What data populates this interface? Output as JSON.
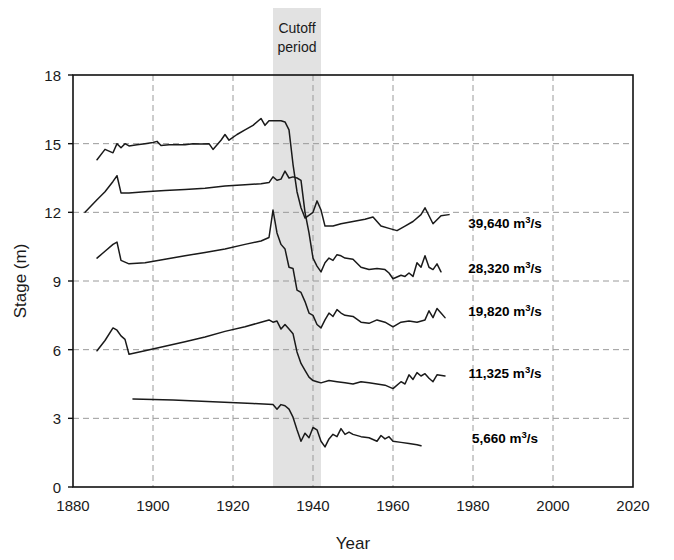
{
  "chart_data": {
    "type": "line",
    "title": "",
    "xlabel": "Year",
    "ylabel": "Stage (m)",
    "xlim": [
      1880,
      2020
    ],
    "ylim": [
      0,
      18
    ],
    "xticks": [
      1880,
      1900,
      1920,
      1940,
      1960,
      1980,
      2000,
      2020
    ],
    "yticks": [
      0,
      3,
      6,
      9,
      12,
      15,
      18
    ],
    "grid": "dashed gray gridlines on both axes, solid black plot frame",
    "legend_position": "inline right of each line end",
    "annotations": [
      {
        "text": "Cutoff period",
        "lines": [
          "Cutoff",
          "period"
        ],
        "type": "shaded-vertical-band",
        "x_start": 1930,
        "x_end": 1942,
        "color": "#e2e2e2"
      }
    ],
    "series": [
      {
        "name": "39,640 m3/s",
        "label_number": "39,640",
        "label_unit": "m",
        "label_sup": "3",
        "label_tail": "/s",
        "label_at_year": 1988,
        "label_at_stage": 11.55,
        "color": "#1a1a1a",
        "points": [
          [
            1886,
            14.3
          ],
          [
            1888,
            14.75
          ],
          [
            1890,
            14.6
          ],
          [
            1891,
            15.0
          ],
          [
            1892,
            14.82
          ],
          [
            1893,
            15.0
          ],
          [
            1894,
            14.9
          ],
          [
            1896,
            14.95
          ],
          [
            1898,
            15.0
          ],
          [
            1900,
            15.05
          ],
          [
            1901,
            15.1
          ],
          [
            1902,
            14.92
          ],
          [
            1904,
            14.95
          ],
          [
            1906,
            14.95
          ],
          [
            1908,
            14.95
          ],
          [
            1910,
            15.0
          ],
          [
            1912,
            14.98
          ],
          [
            1914,
            15.0
          ],
          [
            1915,
            14.75
          ],
          [
            1917,
            15.15
          ],
          [
            1918,
            15.4
          ],
          [
            1919,
            15.15
          ],
          [
            1921,
            15.4
          ],
          [
            1923,
            15.6
          ],
          [
            1925,
            15.8
          ],
          [
            1927,
            16.1
          ],
          [
            1928,
            15.8
          ],
          [
            1929,
            16.0
          ],
          [
            1930,
            16.0
          ],
          [
            1932,
            16.0
          ],
          [
            1933,
            15.95
          ],
          [
            1934,
            15.6
          ],
          [
            1935,
            14.1
          ],
          [
            1936,
            12.9
          ],
          [
            1937,
            12.2
          ],
          [
            1938,
            11.75
          ],
          [
            1940,
            12.0
          ],
          [
            1941,
            12.5
          ],
          [
            1942,
            12.1
          ],
          [
            1943,
            11.4
          ],
          [
            1945,
            11.4
          ],
          [
            1947,
            11.5
          ],
          [
            1950,
            11.6
          ],
          [
            1953,
            11.7
          ],
          [
            1955,
            11.8
          ],
          [
            1957,
            11.4
          ],
          [
            1959,
            11.3
          ],
          [
            1961,
            11.2
          ],
          [
            1963,
            11.4
          ],
          [
            1965,
            11.6
          ],
          [
            1967,
            11.9
          ],
          [
            1968,
            12.2
          ],
          [
            1970,
            11.5
          ],
          [
            1972,
            11.85
          ],
          [
            1974,
            11.9
          ]
        ]
      },
      {
        "name": "28,320 m3/s",
        "label_number": "28,320",
        "label_unit": "m",
        "label_sup": "3",
        "label_tail": "/s",
        "label_at_year": 1988,
        "label_at_stage": 9.55,
        "color": "#1a1a1a",
        "points": [
          [
            1883,
            12.0
          ],
          [
            1886,
            12.55
          ],
          [
            1888,
            12.9
          ],
          [
            1890,
            13.35
          ],
          [
            1891,
            13.6
          ],
          [
            1892,
            12.85
          ],
          [
            1894,
            12.85
          ],
          [
            1898,
            12.9
          ],
          [
            1903,
            12.95
          ],
          [
            1908,
            13.0
          ],
          [
            1913,
            13.05
          ],
          [
            1918,
            13.15
          ],
          [
            1923,
            13.2
          ],
          [
            1927,
            13.25
          ],
          [
            1929,
            13.3
          ],
          [
            1930,
            13.55
          ],
          [
            1931,
            13.4
          ],
          [
            1932,
            13.45
          ],
          [
            1933,
            13.8
          ],
          [
            1934,
            13.5
          ],
          [
            1935,
            13.55
          ],
          [
            1936,
            13.5
          ],
          [
            1937,
            13.4
          ],
          [
            1938,
            12.0
          ],
          [
            1939,
            11.1
          ],
          [
            1940,
            10.0
          ],
          [
            1941,
            9.65
          ],
          [
            1942,
            9.4
          ],
          [
            1943,
            9.8
          ],
          [
            1944,
            10.0
          ],
          [
            1945,
            9.9
          ],
          [
            1946,
            10.15
          ],
          [
            1947,
            10.1
          ],
          [
            1948,
            10.0
          ],
          [
            1950,
            9.95
          ],
          [
            1952,
            9.6
          ],
          [
            1954,
            9.5
          ],
          [
            1956,
            9.55
          ],
          [
            1958,
            9.5
          ],
          [
            1959,
            9.35
          ],
          [
            1960,
            9.1
          ],
          [
            1962,
            9.25
          ],
          [
            1963,
            9.2
          ],
          [
            1964,
            9.35
          ],
          [
            1965,
            9.2
          ],
          [
            1966,
            9.8
          ],
          [
            1967,
            9.6
          ],
          [
            1968,
            10.1
          ],
          [
            1969,
            9.6
          ],
          [
            1970,
            9.5
          ],
          [
            1971,
            9.75
          ],
          [
            1972,
            9.4
          ]
        ]
      },
      {
        "name": "19,820 m3/s",
        "label_number": "19,820",
        "label_unit": "m",
        "label_sup": "3",
        "label_tail": "/s",
        "label_at_year": 1988,
        "label_at_stage": 7.7,
        "color": "#1a1a1a",
        "points": [
          [
            1886,
            10.0
          ],
          [
            1888,
            10.3
          ],
          [
            1890,
            10.6
          ],
          [
            1891,
            10.7
          ],
          [
            1892,
            9.9
          ],
          [
            1894,
            9.75
          ],
          [
            1898,
            9.8
          ],
          [
            1903,
            9.95
          ],
          [
            1908,
            10.1
          ],
          [
            1913,
            10.25
          ],
          [
            1918,
            10.4
          ],
          [
            1923,
            10.6
          ],
          [
            1927,
            10.75
          ],
          [
            1929,
            10.9
          ],
          [
            1930,
            12.1
          ],
          [
            1931,
            11.1
          ],
          [
            1932,
            10.6
          ],
          [
            1933,
            10.4
          ],
          [
            1934,
            9.6
          ],
          [
            1935,
            9.55
          ],
          [
            1936,
            8.6
          ],
          [
            1937,
            8.5
          ],
          [
            1938,
            8.1
          ],
          [
            1939,
            7.6
          ],
          [
            1940,
            7.5
          ],
          [
            1941,
            7.1
          ],
          [
            1942,
            6.95
          ],
          [
            1943,
            7.3
          ],
          [
            1944,
            7.6
          ],
          [
            1945,
            7.45
          ],
          [
            1946,
            7.75
          ],
          [
            1947,
            7.6
          ],
          [
            1948,
            7.5
          ],
          [
            1950,
            7.45
          ],
          [
            1952,
            7.2
          ],
          [
            1954,
            7.15
          ],
          [
            1956,
            7.3
          ],
          [
            1958,
            7.2
          ],
          [
            1960,
            7.0
          ],
          [
            1962,
            7.2
          ],
          [
            1964,
            7.25
          ],
          [
            1966,
            7.2
          ],
          [
            1968,
            7.3
          ],
          [
            1969,
            7.7
          ],
          [
            1970,
            7.4
          ],
          [
            1971,
            7.8
          ],
          [
            1972,
            7.6
          ],
          [
            1973,
            7.4
          ]
        ]
      },
      {
        "name": "11,325 m3/s",
        "label_number": "11,325",
        "label_unit": "m",
        "label_sup": "3",
        "label_tail": "/s",
        "label_at_year": 1988,
        "label_at_stage": 5.0,
        "color": "#1a1a1a",
        "points": [
          [
            1886,
            5.95
          ],
          [
            1888,
            6.4
          ],
          [
            1890,
            6.95
          ],
          [
            1891,
            6.85
          ],
          [
            1892,
            6.6
          ],
          [
            1893,
            6.45
          ],
          [
            1894,
            5.8
          ],
          [
            1898,
            5.95
          ],
          [
            1903,
            6.15
          ],
          [
            1908,
            6.35
          ],
          [
            1913,
            6.55
          ],
          [
            1918,
            6.8
          ],
          [
            1923,
            7.0
          ],
          [
            1927,
            7.2
          ],
          [
            1929,
            7.3
          ],
          [
            1930,
            7.2
          ],
          [
            1931,
            7.25
          ],
          [
            1932,
            6.9
          ],
          [
            1933,
            7.1
          ],
          [
            1934,
            6.9
          ],
          [
            1935,
            6.7
          ],
          [
            1936,
            5.9
          ],
          [
            1937,
            5.4
          ],
          [
            1938,
            5.1
          ],
          [
            1939,
            4.8
          ],
          [
            1940,
            4.65
          ],
          [
            1941,
            4.6
          ],
          [
            1942,
            4.55
          ],
          [
            1944,
            4.65
          ],
          [
            1946,
            4.6
          ],
          [
            1948,
            4.55
          ],
          [
            1950,
            4.5
          ],
          [
            1952,
            4.6
          ],
          [
            1954,
            4.55
          ],
          [
            1956,
            4.5
          ],
          [
            1958,
            4.45
          ],
          [
            1960,
            4.3
          ],
          [
            1962,
            4.6
          ],
          [
            1963,
            4.5
          ],
          [
            1964,
            4.9
          ],
          [
            1965,
            4.7
          ],
          [
            1966,
            5.0
          ],
          [
            1967,
            4.85
          ],
          [
            1968,
            4.95
          ],
          [
            1969,
            4.75
          ],
          [
            1970,
            4.6
          ],
          [
            1971,
            4.9
          ],
          [
            1973,
            4.85
          ]
        ]
      },
      {
        "name": "5,660 m3/s",
        "label_number": "5,660",
        "label_unit": "m",
        "label_sup": "3",
        "label_tail": "/s",
        "label_at_year": 1988,
        "label_at_stage": 2.15,
        "color": "#1a1a1a",
        "points": [
          [
            1895,
            3.85
          ],
          [
            1905,
            3.8
          ],
          [
            1915,
            3.72
          ],
          [
            1925,
            3.65
          ],
          [
            1930,
            3.6
          ],
          [
            1931,
            3.4
          ],
          [
            1932,
            3.6
          ],
          [
            1933,
            3.55
          ],
          [
            1934,
            3.4
          ],
          [
            1935,
            3.05
          ],
          [
            1936,
            2.5
          ],
          [
            1937,
            2.0
          ],
          [
            1938,
            2.35
          ],
          [
            1939,
            2.15
          ],
          [
            1940,
            2.6
          ],
          [
            1941,
            2.5
          ],
          [
            1942,
            2.0
          ],
          [
            1943,
            1.75
          ],
          [
            1944,
            2.1
          ],
          [
            1945,
            2.3
          ],
          [
            1946,
            2.2
          ],
          [
            1947,
            2.55
          ],
          [
            1948,
            2.3
          ],
          [
            1949,
            2.4
          ],
          [
            1950,
            2.3
          ],
          [
            1952,
            2.2
          ],
          [
            1954,
            2.15
          ],
          [
            1956,
            2.0
          ],
          [
            1957,
            2.25
          ],
          [
            1958,
            2.1
          ],
          [
            1959,
            2.2
          ],
          [
            1960,
            2.0
          ],
          [
            1962,
            1.95
          ],
          [
            1964,
            1.9
          ],
          [
            1966,
            1.85
          ],
          [
            1967,
            1.8
          ]
        ]
      }
    ]
  },
  "axes": {
    "x_title": "Year",
    "y_title": "Stage (m)",
    "x_tick_labels": [
      "1880",
      "1900",
      "1920",
      "1940",
      "1960",
      "1980",
      "2000",
      "2020"
    ],
    "y_tick_labels": [
      "0",
      "3",
      "6",
      "9",
      "12",
      "15",
      "18"
    ]
  },
  "annotation": {
    "cutoff_line1": "Cutoff",
    "cutoff_line2": "period"
  },
  "colors": {
    "line": "#1a1a1a",
    "grid": "#9a9a9a",
    "frame": "#111111",
    "band": "#e2e2e2",
    "text": "#1a1a1a",
    "background": "#ffffff"
  }
}
